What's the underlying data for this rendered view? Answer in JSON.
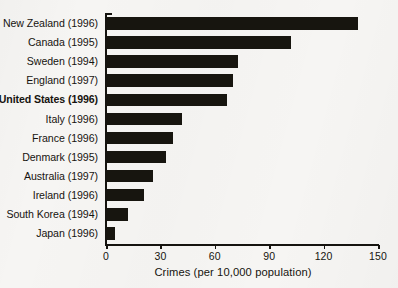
{
  "chart_data": {
    "type": "bar",
    "orientation": "horizontal",
    "title": "",
    "subtitle": "",
    "xlabel": "Crimes (per 10,000 population)",
    "ylabel": "",
    "xlim": [
      0,
      150
    ],
    "xticks": [
      0,
      30,
      60,
      90,
      120,
      150
    ],
    "xtick_labels": [
      "0",
      "30",
      "60",
      "90",
      "120",
      "150"
    ],
    "grid": false,
    "legend": null,
    "bar_color": "#17150f",
    "background_color": "#f6f5f3",
    "highlighted_category": "United States (1996)",
    "categories": [
      "New Zealand (1996)",
      "Canada (1995)",
      "Sweden (1994)",
      "England (1997)",
      "United States (1996)",
      "Italy (1996)",
      "France (1996)",
      "Denmark (1995)",
      "Australia (1997)",
      "Ireland (1996)",
      "South Korea (1994)",
      "Japan (1996)"
    ],
    "values": [
      139,
      102,
      73,
      70,
      67,
      42,
      37,
      33,
      26,
      21,
      12,
      5
    ],
    "bars": [
      {
        "label": "New Zealand (1996)",
        "value": 139,
        "bold": false
      },
      {
        "label": "Canada (1995)",
        "value": 102,
        "bold": false
      },
      {
        "label": "Sweden (1994)",
        "value": 73,
        "bold": false
      },
      {
        "label": "England (1997)",
        "value": 70,
        "bold": false
      },
      {
        "label": "United States (1996)",
        "value": 67,
        "bold": true
      },
      {
        "label": "Italy (1996)",
        "value": 42,
        "bold": false
      },
      {
        "label": "France (1996)",
        "value": 37,
        "bold": false
      },
      {
        "label": "Denmark (1995)",
        "value": 33,
        "bold": false
      },
      {
        "label": "Australia (1997)",
        "value": 26,
        "bold": false
      },
      {
        "label": "Ireland (1996)",
        "value": 21,
        "bold": false
      },
      {
        "label": "South Korea (1994)",
        "value": 12,
        "bold": false
      },
      {
        "label": "Japan (1996)",
        "value": 5,
        "bold": false
      }
    ]
  }
}
